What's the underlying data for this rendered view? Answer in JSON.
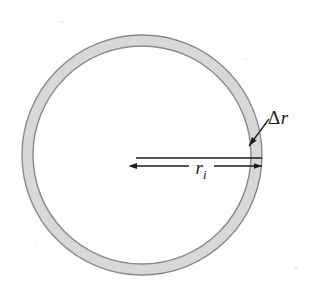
{
  "figure": {
    "kind": "annulus-diagram",
    "background_color": "#ffffff",
    "width": 316,
    "height": 289
  },
  "annulus": {
    "name": "ring",
    "center_x": 142,
    "center_y": 155,
    "outer_radius": 120,
    "inner_radius": 109,
    "band_fill_color": "#d8d8d6",
    "band_stroke_color": "#8a8a88",
    "interior_fill_color": "#ffffff"
  },
  "labels": {
    "delta_r": {
      "delta_symbol": "Δ",
      "variable": "r",
      "full_text": "Δr",
      "x": 268,
      "y": 124,
      "font_size": 19,
      "color": "#1c1c1c"
    },
    "inner_radius": {
      "variable": "r",
      "subscript": "i",
      "full_text": "rᵢ",
      "x": 201,
      "y": 174,
      "font_size": 19,
      "color": "#1c1c1c"
    }
  },
  "dimension_arrow": {
    "name": "inner-radius-dimension",
    "y": 166,
    "x_start": 137,
    "x_end": 262,
    "guide_line_y": 158,
    "guide_line_x_start": 136,
    "guide_line_x_end": 262,
    "stroke_color": "#1c1c1c",
    "left_arrowhead": true,
    "right_arrowhead": true
  },
  "leader_line": {
    "name": "delta-r-leader",
    "x_start": 269,
    "y_start": 119,
    "x_end": 249,
    "y_end": 146,
    "stroke_color": "#1c1c1c",
    "arrowhead_at_end": true
  },
  "speckles": [
    {
      "x": 62,
      "y": 22,
      "r": 1.1
    },
    {
      "x": 143,
      "y": 144,
      "r": 1.3
    },
    {
      "x": 296,
      "y": 268,
      "r": 1.2
    },
    {
      "x": 246,
      "y": 59,
      "r": 0.9
    },
    {
      "x": 37,
      "y": 246,
      "r": 0.8
    },
    {
      "x": 211,
      "y": 227,
      "r": 0.7
    }
  ]
}
